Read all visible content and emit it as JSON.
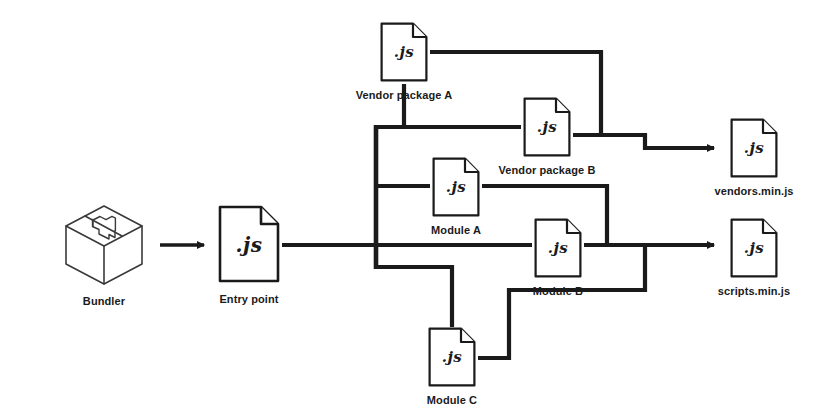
{
  "diagram": {
    "background_color": "#ffffff",
    "line_color": "#1a1a1a",
    "text_color": "#1a1a1a"
  },
  "nodes": {
    "bundler": {
      "caption": "Bundler",
      "icon": "cube-box-icon",
      "x": 62,
      "y": 203,
      "w": 84,
      "h": 84
    },
    "entry_point": {
      "caption": "Entry point",
      "ext": ".js",
      "icon": "js-file-icon",
      "x": 218,
      "y": 205,
      "w": 62,
      "h": 78
    },
    "vendor_a": {
      "caption": "Vendor package A",
      "ext": ".js",
      "icon": "js-file-icon",
      "x": 380,
      "y": 22,
      "w": 48,
      "h": 60
    },
    "vendor_b": {
      "caption": "Vendor package B",
      "ext": ".js",
      "icon": "js-file-icon",
      "x": 523,
      "y": 97,
      "w": 48,
      "h": 60
    },
    "module_a": {
      "caption": "Module A",
      "ext": ".js",
      "icon": "js-file-icon",
      "x": 432,
      "y": 157,
      "w": 48,
      "h": 60
    },
    "module_b": {
      "caption": "Module B",
      "ext": ".js",
      "icon": "js-file-icon",
      "x": 534,
      "y": 218,
      "w": 48,
      "h": 60
    },
    "module_c": {
      "caption": "Module C",
      "ext": ".js",
      "icon": "js-file-icon",
      "x": 428,
      "y": 327,
      "w": 48,
      "h": 60
    },
    "vendors_bundle": {
      "caption": "vendors.min.js",
      "ext": ".js",
      "icon": "js-file-icon",
      "x": 730,
      "y": 118,
      "w": 48,
      "h": 60
    },
    "scripts_bundle": {
      "caption": "scripts.min.js",
      "ext": ".js",
      "icon": "js-file-icon",
      "x": 730,
      "y": 218,
      "w": 48,
      "h": 60
    }
  },
  "edges": [
    {
      "name": "bundler-to-entry",
      "from": "bundler",
      "to": "entry_point",
      "arrow": true
    },
    {
      "name": "entry-to-trunk",
      "from": "entry_point",
      "to": "trunk",
      "arrow": false
    },
    {
      "name": "trunk-to-vendor-a",
      "from": "trunk",
      "to": "vendor_a",
      "arrow": false
    },
    {
      "name": "trunk-to-vendor-b",
      "from": "trunk",
      "to": "vendor_b",
      "arrow": false
    },
    {
      "name": "trunk-to-module-a",
      "from": "trunk",
      "to": "module_a",
      "arrow": false
    },
    {
      "name": "trunk-to-module-b",
      "from": "trunk",
      "to": "module_b",
      "arrow": false
    },
    {
      "name": "trunk-to-module-c",
      "from": "trunk",
      "to": "module_c",
      "arrow": false
    },
    {
      "name": "vendor-a-to-vendors-bundle",
      "from": "vendor_a",
      "to": "vendors_bundle",
      "arrow": true
    },
    {
      "name": "vendor-b-to-vendors-bundle",
      "from": "vendor_b",
      "to": "vendors_bundle",
      "arrow": true
    },
    {
      "name": "module-a-to-scripts-bundle",
      "from": "module_a",
      "to": "scripts_bundle",
      "arrow": true
    },
    {
      "name": "module-b-to-scripts-bundle",
      "from": "module_b",
      "to": "scripts_bundle",
      "arrow": true
    },
    {
      "name": "module-c-to-scripts-bundle",
      "from": "module_c",
      "to": "scripts_bundle",
      "arrow": true
    }
  ]
}
